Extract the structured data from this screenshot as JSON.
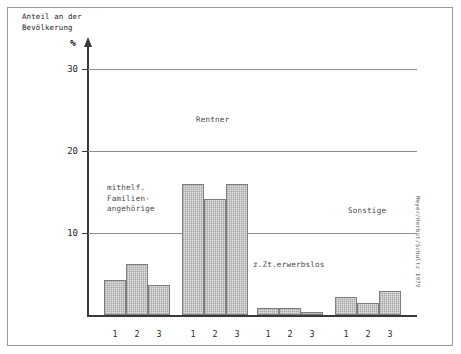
{
  "chart_data": {
    "type": "bar",
    "title": "",
    "subtitle": "",
    "ylabel": "Anteil an der Bevölkerung",
    "yunit": "%",
    "xlabel": "",
    "ylim": [
      0,
      33
    ],
    "yticks": [
      10,
      20,
      30
    ],
    "ytick_labels": [
      "10",
      "20",
      "30"
    ],
    "grid": true,
    "legend": "none",
    "categories": [
      "mithelf. Familienangehörige",
      "Rentner",
      "z.Zt.erwerbslos",
      "Sonstige"
    ],
    "series_labels": [
      "1",
      "2",
      "3"
    ],
    "groups": [
      {
        "label_lines": [
          "mithelf.",
          "Familien-",
          "angehörige"
        ],
        "bars": [
          {
            "tick": "1",
            "value": 4.3
          },
          {
            "tick": "2",
            "value": 6.2
          },
          {
            "tick": "3",
            "value": 3.6
          }
        ]
      },
      {
        "label_lines": [
          "Rentner"
        ],
        "bars": [
          {
            "tick": "1",
            "value": 16.0
          },
          {
            "tick": "2",
            "value": 14.1
          },
          {
            "tick": "3",
            "value": 16.0
          }
        ]
      },
      {
        "label_lines": [
          "z.Zt.erwerbslos"
        ],
        "bars": [
          {
            "tick": "1",
            "value": 0.9
          },
          {
            "tick": "2",
            "value": 0.9
          },
          {
            "tick": "3",
            "value": 0.4
          }
        ]
      },
      {
        "label_lines": [
          "Sonstige"
        ],
        "bars": [
          {
            "tick": "1",
            "value": 2.2
          },
          {
            "tick": "2",
            "value": 1.5
          },
          {
            "tick": "3",
            "value": 2.9
          }
        ]
      }
    ],
    "colors": {
      "bar_fill": "#e2e2e2",
      "bar_border": "#7e7e7e",
      "gridline": "#8e8e8e",
      "axis": "#3a3a3a",
      "frame": "#9a9a9a",
      "text": "#1e1e1e",
      "label_text": "#4a4a4a"
    }
  },
  "axis": {
    "y_title_line1": "Anteil an der",
    "y_title_line2": "Bevölkerung",
    "y_unit": "%",
    "ytick_0": "30",
    "ytick_1": "20",
    "ytick_2": "10"
  },
  "xticks": {
    "g0_t0": "1",
    "g0_t1": "2",
    "g0_t2": "3",
    "g1_t0": "1",
    "g1_t1": "2",
    "g1_t2": "3",
    "g2_t0": "1",
    "g2_t1": "2",
    "g2_t2": "3",
    "g3_t0": "1",
    "g3_t1": "2",
    "g3_t2": "3"
  },
  "labels": {
    "cat_mithelf_l1": "mithelf.",
    "cat_mithelf_l2": "Familien-",
    "cat_mithelf_l3": "angehörige",
    "cat_rentner": "Rentner",
    "cat_erwerbslos": "z.Zt.erwerbslos",
    "cat_sonstige": "Sonstige"
  },
  "credit": {
    "text": "Meyer/Herbst/Schultz 1979"
  }
}
